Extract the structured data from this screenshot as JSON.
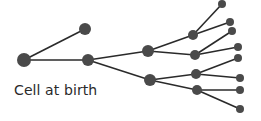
{
  "diagram": {
    "label": "Cell at birth",
    "colors": {
      "node": "#4a4a4a",
      "edge": "#2a2a2a",
      "text": "#2a2a2a"
    },
    "nodes": [
      {
        "id": "root",
        "x": 24,
        "y": 60,
        "r": 7
      },
      {
        "id": "g1a",
        "x": 85,
        "y": 29,
        "r": 6
      },
      {
        "id": "g1b",
        "x": 88,
        "y": 60,
        "r": 6
      },
      {
        "id": "g2a",
        "x": 148,
        "y": 51,
        "r": 6
      },
      {
        "id": "g2b",
        "x": 150,
        "y": 80,
        "r": 6
      },
      {
        "id": "g3a",
        "x": 193,
        "y": 35,
        "r": 5
      },
      {
        "id": "g3b",
        "x": 195,
        "y": 55,
        "r": 5
      },
      {
        "id": "g3c",
        "x": 196,
        "y": 74,
        "r": 5
      },
      {
        "id": "g3d",
        "x": 197,
        "y": 90,
        "r": 5
      },
      {
        "id": "g4a",
        "x": 222,
        "y": 4,
        "r": 4
      },
      {
        "id": "g4b",
        "x": 230,
        "y": 22,
        "r": 4
      },
      {
        "id": "g4c",
        "x": 232,
        "y": 31,
        "r": 4
      },
      {
        "id": "g4d",
        "x": 238,
        "y": 47,
        "r": 4
      },
      {
        "id": "g4e",
        "x": 238,
        "y": 58,
        "r": 4
      },
      {
        "id": "g4f",
        "x": 240,
        "y": 78,
        "r": 4
      },
      {
        "id": "g4g",
        "x": 240,
        "y": 90,
        "r": 4
      },
      {
        "id": "g4h",
        "x": 240,
        "y": 109,
        "r": 4
      }
    ],
    "edges": [
      [
        "root",
        "g1a"
      ],
      [
        "root",
        "g1b"
      ],
      [
        "g1b",
        "g2a"
      ],
      [
        "g1b",
        "g2b"
      ],
      [
        "g2a",
        "g3a"
      ],
      [
        "g2a",
        "g3b"
      ],
      [
        "g2b",
        "g3c"
      ],
      [
        "g2b",
        "g3d"
      ],
      [
        "g3a",
        "g4a"
      ],
      [
        "g3a",
        "g4b"
      ],
      [
        "g3b",
        "g4c"
      ],
      [
        "g3b",
        "g4d"
      ],
      [
        "g3c",
        "g4e"
      ],
      [
        "g3c",
        "g4f"
      ],
      [
        "g3d",
        "g4g"
      ],
      [
        "g3d",
        "g4h"
      ]
    ]
  }
}
